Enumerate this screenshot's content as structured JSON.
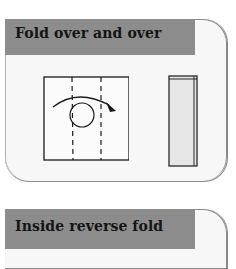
{
  "panels": [
    {
      "title": "Fold over and over",
      "illustrations": [
        "square-with-two-dashed-fold-lines-and-curved-arrow",
        "narrow-folded-strip"
      ]
    },
    {
      "title": "Inside reverse fold"
    }
  ],
  "colors": {
    "header_bg": "#8c8c8c",
    "panel_bg": "#f7f7f7",
    "border": "#8a8a8a",
    "strip_fill": "#e6e6e6"
  }
}
